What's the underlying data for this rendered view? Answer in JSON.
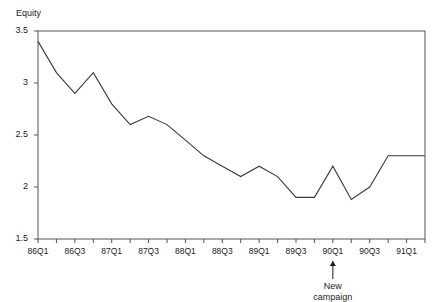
{
  "chart_data": {
    "type": "line",
    "title": "",
    "subtitle": "",
    "ylabel": "Equity",
    "xlabel": "",
    "ylim": [
      1.5,
      3.5
    ],
    "yticks": [
      "1.5",
      "2",
      "2.5",
      "3",
      "3.5"
    ],
    "ytick_values": [
      1.5,
      2,
      2.5,
      3,
      3.5
    ],
    "grid": false,
    "legend": "none",
    "categories": [
      "86Q1",
      "86Q2",
      "86Q3",
      "86Q4",
      "87Q1",
      "87Q2",
      "87Q3",
      "87Q4",
      "88Q1",
      "88Q2",
      "88Q3",
      "88Q4",
      "89Q1",
      "89Q2",
      "89Q3",
      "89Q4",
      "90Q1",
      "90Q2",
      "90Q3",
      "90Q4",
      "91Q1",
      "91Q2"
    ],
    "xtick_labels_shown": [
      "86Q1",
      "86Q3",
      "87Q1",
      "87Q3",
      "88Q1",
      "88Q3",
      "89Q1",
      "89Q3",
      "90Q1",
      "90Q3",
      "91Q1"
    ],
    "values": [
      3.4,
      3.1,
      2.9,
      3.1,
      2.8,
      2.6,
      2.68,
      2.6,
      2.45,
      2.3,
      2.2,
      2.1,
      2.2,
      2.1,
      1.9,
      1.9,
      2.2,
      1.88,
      2.0,
      2.3,
      2.3,
      2.3
    ],
    "annotations": [
      {
        "text_line1": "New",
        "text_line2": "campaign",
        "at_category": "90Q1",
        "marker": "up-arrow"
      }
    ]
  },
  "colors": {
    "line": "#3a3a3a",
    "frame": "#555555",
    "text": "#1a1a1a",
    "background": "#ffffff"
  }
}
